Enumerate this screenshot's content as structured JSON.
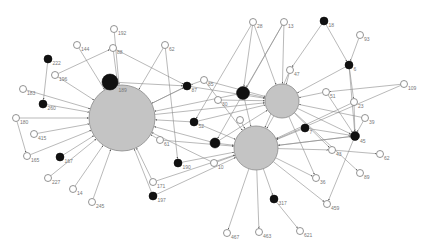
{
  "title": "",
  "colors": {
    "hub": "#c4c4c4",
    "black": "#111111",
    "white": "#ffffff",
    "edge": "#8a8a8a",
    "label": "#777777"
  },
  "nodes": [
    {
      "id": "hubA",
      "type": "hub",
      "label": ""
    },
    {
      "id": "hubB",
      "type": "hub",
      "label": ""
    },
    {
      "id": "hubC",
      "type": "hub",
      "label": ""
    },
    {
      "id": "192",
      "type": "white",
      "label": "192"
    },
    {
      "id": "144",
      "type": "white",
      "label": "144"
    },
    {
      "id": "88",
      "type": "white",
      "label": "88"
    },
    {
      "id": "222",
      "type": "black",
      "label": "222"
    },
    {
      "id": "196",
      "type": "white",
      "label": "196"
    },
    {
      "id": "189",
      "type": "black-large",
      "label": "189"
    },
    {
      "id": "183",
      "type": "white",
      "label": "183"
    },
    {
      "id": "260",
      "type": "black",
      "label": "260"
    },
    {
      "id": "180",
      "type": "white",
      "label": "180"
    },
    {
      "id": "415",
      "type": "white",
      "label": "415"
    },
    {
      "id": "165",
      "type": "white",
      "label": "165"
    },
    {
      "id": "167",
      "type": "black",
      "label": "167"
    },
    {
      "id": "227",
      "type": "white",
      "label": "227"
    },
    {
      "id": "14",
      "type": "white",
      "label": "14"
    },
    {
      "id": "245",
      "type": "white",
      "label": "245"
    },
    {
      "id": "62a",
      "type": "white",
      "label": "62"
    },
    {
      "id": "87",
      "type": "black",
      "label": "87"
    },
    {
      "id": "85",
      "type": "white",
      "label": "85"
    },
    {
      "id": "28",
      "type": "white",
      "label": "28"
    },
    {
      "id": "13",
      "type": "white",
      "label": "13"
    },
    {
      "id": "18",
      "type": "black",
      "label": "18"
    },
    {
      "id": "93",
      "type": "white",
      "label": "93"
    },
    {
      "id": "6",
      "type": "black",
      "label": "6"
    },
    {
      "id": "bigblack",
      "type": "black-large",
      "label": ""
    },
    {
      "id": "47",
      "type": "white",
      "label": "47"
    },
    {
      "id": "51",
      "type": "white",
      "label": "51"
    },
    {
      "id": "23",
      "type": "white",
      "label": "23"
    },
    {
      "id": "109",
      "type": "white",
      "label": "109"
    },
    {
      "id": "39",
      "type": "white",
      "label": "39"
    },
    {
      "id": "45",
      "type": "black",
      "label": "45"
    },
    {
      "id": "62b",
      "type": "white",
      "label": "62"
    },
    {
      "id": "43",
      "type": "white",
      "label": "43"
    },
    {
      "id": "89",
      "type": "white",
      "label": "89"
    },
    {
      "id": "36",
      "type": "white",
      "label": "36"
    },
    {
      "id": "459",
      "type": "white",
      "label": "459"
    },
    {
      "id": "621",
      "type": "white",
      "label": "621"
    },
    {
      "id": "317",
      "type": "black",
      "label": "317"
    },
    {
      "id": "463",
      "type": "white",
      "label": "463"
    },
    {
      "id": "467",
      "type": "white",
      "label": "467"
    },
    {
      "id": "197",
      "type": "black",
      "label": "197"
    },
    {
      "id": "171",
      "type": "white",
      "label": "171"
    },
    {
      "id": "190",
      "type": "black",
      "label": "190"
    },
    {
      "id": "10",
      "type": "white",
      "label": "10"
    },
    {
      "id": "mid1",
      "type": "black",
      "label": "52"
    },
    {
      "id": "mid2",
      "type": "black",
      "label": ""
    },
    {
      "id": "61",
      "type": "white",
      "label": "61"
    },
    {
      "id": "7",
      "type": "black",
      "label": "7"
    },
    {
      "id": "w1",
      "type": "white",
      "label": "30"
    },
    {
      "id": "w2",
      "type": "white",
      "label": ""
    }
  ],
  "edges": [
    [
      "192",
      "hubA"
    ],
    [
      "144",
      "hubA"
    ],
    [
      "88",
      "hubA"
    ],
    [
      "196",
      "88"
    ],
    [
      "222",
      "260"
    ],
    [
      "196",
      "hubA"
    ],
    [
      "183",
      "hubA"
    ],
    [
      "260",
      "hubA"
    ],
    [
      "180",
      "hubA"
    ],
    [
      "180",
      "165"
    ],
    [
      "415",
      "hubA"
    ],
    [
      "165",
      "hubA"
    ],
    [
      "167",
      "hubA"
    ],
    [
      "227",
      "hubA"
    ],
    [
      "14",
      "hubA"
    ],
    [
      "245",
      "hubA"
    ],
    [
      "189",
      "hubA"
    ],
    [
      "62a",
      "hubA"
    ],
    [
      "88",
      "87"
    ],
    [
      "189",
      "87"
    ],
    [
      "62a",
      "190"
    ],
    [
      "87",
      "hubA"
    ],
    [
      "hubA",
      "87"
    ],
    [
      "85",
      "87"
    ],
    [
      "28",
      "hubB"
    ],
    [
      "13",
      "hubB"
    ],
    [
      "28",
      "bigblack"
    ],
    [
      "13",
      "bigblack"
    ],
    [
      "18",
      "47"
    ],
    [
      "18",
      "6"
    ],
    [
      "93",
      "6"
    ],
    [
      "6",
      "23"
    ],
    [
      "6",
      "hubB"
    ],
    [
      "bigblack",
      "hubB"
    ],
    [
      "47",
      "hubB"
    ],
    [
      "51",
      "hubB"
    ],
    [
      "hubB",
      "hubC"
    ],
    [
      "109",
      "51"
    ],
    [
      "109",
      "hubC"
    ],
    [
      "39",
      "45"
    ],
    [
      "23",
      "45"
    ],
    [
      "hubB",
      "45"
    ],
    [
      "hubC",
      "45"
    ],
    [
      "7",
      "45"
    ],
    [
      "45",
      "hubC"
    ],
    [
      "45",
      "459"
    ],
    [
      "43",
      "62b"
    ],
    [
      "hubC",
      "43"
    ],
    [
      "hubB",
      "89"
    ],
    [
      "hubC",
      "36"
    ],
    [
      "hubC",
      "459"
    ],
    [
      "hubC",
      "317"
    ],
    [
      "317",
      "621"
    ],
    [
      "hubC",
      "463"
    ],
    [
      "hubC",
      "467"
    ],
    [
      "190",
      "hubC"
    ],
    [
      "197",
      "hubC"
    ],
    [
      "171",
      "hubC"
    ],
    [
      "10",
      "hubC"
    ],
    [
      "mid1",
      "hubA"
    ],
    [
      "mid1",
      "hubB"
    ],
    [
      "mid2",
      "hubC"
    ],
    [
      "mid2",
      "hubA"
    ],
    [
      "61",
      "hubA"
    ],
    [
      "61",
      "hubC"
    ],
    [
      "7",
      "hubC"
    ],
    [
      "bigblack",
      "hubA"
    ],
    [
      "87",
      "hubB"
    ],
    [
      "85",
      "hubB"
    ],
    [
      "w1",
      "hubB"
    ],
    [
      "w2",
      "hubC"
    ],
    [
      "171",
      "hubA"
    ],
    [
      "197",
      "hubA"
    ],
    [
      "10",
      "hubA"
    ],
    [
      "mid1",
      "hubC"
    ],
    [
      "hubB",
      "36"
    ],
    [
      "hubB",
      "43"
    ],
    [
      "51",
      "45"
    ],
    [
      "47",
      "hubC"
    ],
    [
      "mid2",
      "hubB"
    ],
    [
      "bigblack",
      "hubC"
    ],
    [
      "6",
      "45"
    ],
    [
      "hubA",
      "hubB"
    ],
    [
      "28",
      "mid1"
    ],
    [
      "13",
      "mid2"
    ],
    [
      "85",
      "hubC"
    ],
    [
      "23",
      "hubC"
    ],
    [
      "39",
      "hubB"
    ]
  ]
}
